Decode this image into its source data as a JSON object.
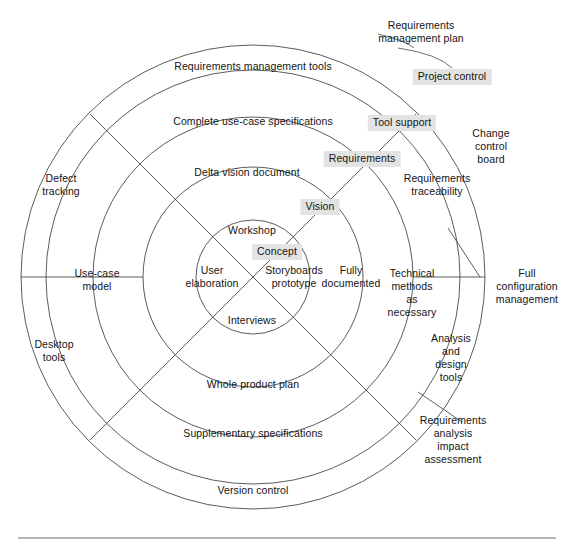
{
  "diagram": {
    "type": "concentric-rings",
    "center": {
      "x": 253,
      "y": 277
    },
    "ring_radii": [
      57,
      110,
      160,
      207,
      232
    ],
    "colors": {
      "stroke": "#4a4a4a",
      "highlight_background": "#e3e3e3",
      "text": "#141414",
      "rule": "#6a6a6a"
    },
    "inner_core": {
      "labels": [
        {
          "id": "workshop",
          "text": "Workshop",
          "x": 252,
          "y": 230,
          "highlight": false
        },
        {
          "id": "concept",
          "text": "Concept",
          "x": 277,
          "y": 252,
          "highlight": true
        },
        {
          "id": "user-elaboration",
          "text": "User\nelaboration",
          "x": 212,
          "y": 277,
          "highlight": false
        },
        {
          "id": "storyboards-prototype",
          "text": "Storyboards\nprototype",
          "x": 294,
          "y": 277,
          "highlight": false
        },
        {
          "id": "interviews",
          "text": "Interviews",
          "x": 252,
          "y": 320,
          "highlight": false
        }
      ]
    },
    "rings": [
      {
        "index": 1,
        "name": "ring-1",
        "segments": [
          {
            "id": "vision",
            "text": "Vision",
            "x": 320,
            "y": 207,
            "highlight": true
          },
          {
            "id": "fully-documented",
            "text": "Fully\ndocumented",
            "x": 351,
            "y": 277,
            "highlight": false
          }
        ]
      },
      {
        "index": 2,
        "name": "ring-2",
        "segments": [
          {
            "id": "delta-vision-document",
            "text": "Delta vision document",
            "x": 247,
            "y": 172,
            "highlight": false
          },
          {
            "id": "requirements",
            "text": "Requirements",
            "x": 362,
            "y": 159,
            "highlight": true
          },
          {
            "id": "technical-methods",
            "text": "Technical\nmethods\nas\nnecessary",
            "x": 412,
            "y": 293,
            "highlight": false
          }
        ]
      },
      {
        "index": 3,
        "name": "ring-3",
        "segments": [
          {
            "id": "complete-use-case-specifications",
            "text": "Complete use-case specifications",
            "x": 253,
            "y": 121,
            "highlight": false
          },
          {
            "id": "tool-support",
            "text": "Tool support",
            "x": 402,
            "y": 123,
            "highlight": true
          },
          {
            "id": "requirements-traceability",
            "text": "Requirements\ntraceability",
            "x": 437,
            "y": 185,
            "highlight": false
          },
          {
            "id": "analysis-and-design-tools",
            "text": "Analysis\nand\ndesign\ntools",
            "x": 451,
            "y": 358,
            "highlight": false
          },
          {
            "id": "requirements-analysis-impact",
            "text": "Requirements\nanalysis\nimpact\nassessment",
            "x": 453,
            "y": 440,
            "highlight": false
          },
          {
            "id": "supplementary-specifications",
            "text": "Supplementary specifications",
            "x": 253,
            "y": 433,
            "highlight": false
          },
          {
            "id": "whole-product-plan",
            "text": "Whole product plan",
            "x": 253,
            "y": 384,
            "highlight": false
          },
          {
            "id": "use-case-model",
            "text": "Use-case\nmodel",
            "x": 97,
            "y": 280,
            "highlight": false
          }
        ]
      },
      {
        "index": 4,
        "name": "ring-4-outer",
        "segments": [
          {
            "id": "requirements-management-tools",
            "text": "Requirements management tools",
            "x": 253,
            "y": 66,
            "highlight": false
          },
          {
            "id": "project-control",
            "text": "Project control",
            "x": 452,
            "y": 77,
            "highlight": true
          },
          {
            "id": "change-control-board",
            "text": "Change\ncontrol\nboard",
            "x": 491,
            "y": 146,
            "highlight": false
          },
          {
            "id": "full-configuration-management",
            "text": "Full\nconfiguration\nmanagement",
            "x": 527,
            "y": 286,
            "highlight": false
          },
          {
            "id": "version-control",
            "text": "Version control",
            "x": 253,
            "y": 490,
            "highlight": false
          },
          {
            "id": "defect-tracking",
            "text": "Defect\ntracking",
            "x": 61,
            "y": 185,
            "highlight": false
          },
          {
            "id": "desktop-tools",
            "text": "Desktop\ntools",
            "x": 54,
            "y": 351,
            "highlight": false
          }
        ]
      }
    ],
    "callouts": [
      {
        "id": "requirements-management-plan",
        "text": "Requirements\nmanagement plan",
        "x": 421,
        "y": 32,
        "highlight": false,
        "leader_from": {
          "x": 404,
          "y": 48
        },
        "leader_to": {
          "x": 455,
          "y": 66
        }
      }
    ],
    "footer_rule": {
      "y": 538,
      "x1": 18,
      "x2": 556
    }
  }
}
